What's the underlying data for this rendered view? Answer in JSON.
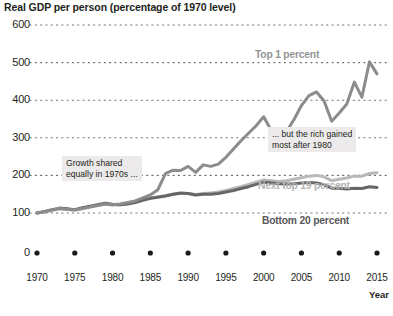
{
  "chart_data": {
    "type": "line",
    "title": "Real GDP per person (percentage of 1970 level)",
    "xlabel": "Year",
    "ylabel": "",
    "ylim": [
      0,
      600
    ],
    "xlim": [
      1970,
      2015
    ],
    "grid": true,
    "grid_style": "dotted",
    "legend": "inline-labels",
    "y_ticks": [
      600,
      500,
      400,
      300,
      200,
      100,
      0
    ],
    "x_ticks": [
      1970,
      1975,
      1980,
      1985,
      1990,
      1995,
      2000,
      2005,
      2010,
      2015
    ],
    "axis_break_between": [
      0,
      100
    ],
    "colors": {
      "top_1_percent": "#8c8c8c",
      "next_top_19_percent": "#b9b9b9",
      "bottom_20_percent": "#666669",
      "gridline": "#6d6d6d",
      "callout_background": "#eceaea",
      "text": "#231f20"
    },
    "series": [
      {
        "name": "Top 1 percent",
        "color": "#8c8c8c",
        "x": [
          1970,
          1971,
          1972,
          1973,
          1974,
          1975,
          1976,
          1977,
          1978,
          1979,
          1980,
          1981,
          1982,
          1983,
          1984,
          1985,
          1986,
          1987,
          1988,
          1989,
          1990,
          1991,
          1992,
          1993,
          1994,
          1995,
          1996,
          1997,
          1998,
          1999,
          2000,
          2001,
          2002,
          2003,
          2004,
          2005,
          2006,
          2007,
          2008,
          2009,
          2010,
          2011,
          2012,
          2013,
          2014,
          2015
        ],
        "values": [
          100,
          103,
          108,
          112,
          110,
          108,
          112,
          116,
          120,
          124,
          122,
          124,
          128,
          132,
          140,
          148,
          162,
          205,
          214,
          213,
          224,
          208,
          228,
          224,
          230,
          248,
          270,
          292,
          312,
          332,
          356,
          320,
          302,
          316,
          348,
          386,
          412,
          422,
          398,
          344,
          366,
          390,
          448,
          408,
          502,
          470
        ]
      },
      {
        "name": "Next top 19 percent",
        "color": "#b9b9b9",
        "x": [
          1970,
          1971,
          1972,
          1973,
          1974,
          1975,
          1976,
          1977,
          1978,
          1979,
          1980,
          1981,
          1982,
          1983,
          1984,
          1985,
          1986,
          1987,
          1988,
          1989,
          1990,
          1991,
          1992,
          1993,
          1994,
          1995,
          1996,
          1997,
          1998,
          1999,
          2000,
          2001,
          2002,
          2003,
          2004,
          2005,
          2006,
          2007,
          2008,
          2009,
          2010,
          2011,
          2012,
          2013,
          2014,
          2015
        ],
        "values": [
          100,
          103,
          107,
          111,
          109,
          108,
          112,
          116,
          120,
          123,
          121,
          122,
          125,
          129,
          134,
          139,
          143,
          146,
          150,
          152,
          152,
          149,
          152,
          153,
          156,
          160,
          165,
          170,
          176,
          182,
          188,
          186,
          184,
          186,
          190,
          194,
          198,
          200,
          196,
          186,
          190,
          193,
          198,
          198,
          205,
          207
        ]
      },
      {
        "name": "Bottom 20 percent",
        "color": "#666669",
        "x": [
          1970,
          1971,
          1972,
          1973,
          1974,
          1975,
          1976,
          1977,
          1978,
          1979,
          1980,
          1981,
          1982,
          1983,
          1984,
          1985,
          1986,
          1987,
          1988,
          1989,
          1990,
          1991,
          1992,
          1993,
          1994,
          1995,
          1996,
          1997,
          1998,
          1999,
          2000,
          2001,
          2002,
          2003,
          2004,
          2005,
          2006,
          2007,
          2008,
          2009,
          2010,
          2011,
          2012,
          2013,
          2014,
          2015
        ],
        "values": [
          100,
          104,
          109,
          113,
          111,
          109,
          114,
          118,
          122,
          126,
          123,
          122,
          124,
          128,
          134,
          139,
          142,
          145,
          150,
          153,
          152,
          148,
          150,
          150,
          152,
          156,
          160,
          165,
          170,
          176,
          182,
          180,
          178,
          177,
          178,
          180,
          181,
          180,
          175,
          166,
          166,
          164,
          166,
          165,
          170,
          168
        ]
      }
    ],
    "annotations": [
      {
        "name": "growth-shared",
        "text": "Growth shared\nequally in 1970s ...",
        "x_px": 62,
        "y_px": 156
      },
      {
        "name": "rich-gained",
        "text": "... but the rich gained\nmost after 1980",
        "x_px": 268,
        "y_px": 127
      }
    ]
  },
  "labels": {
    "top1": "Top 1 percent",
    "next19": "Next top 19 percent",
    "bottom20": "Bottom 20 percent",
    "year_axis": "Year"
  }
}
